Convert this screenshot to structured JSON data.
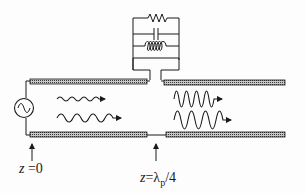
{
  "diagram": {
    "type": "transmission-line-with-shunt-resonator",
    "colors": {
      "ink": "#1a1a1a",
      "conductor_fill": "#8a8a8a",
      "background": "#fdfdfd"
    },
    "components": {
      "source": {
        "icon": "ac-source-icon"
      },
      "resonator": {
        "elements": [
          "resistor",
          "capacitor",
          "inductor"
        ],
        "connection": "parallel"
      },
      "conductors": [
        "top-left",
        "top-right",
        "bottom-left",
        "bottom-right"
      ]
    },
    "waves": {
      "left": [
        {
          "amplitude": "small",
          "direction": "right"
        },
        {
          "amplitude": "medium",
          "direction": "right"
        }
      ],
      "right": [
        {
          "amplitude": "large",
          "direction": "right"
        },
        {
          "amplitude": "large",
          "direction": "right"
        }
      ]
    },
    "labels": {
      "z0_var": "z",
      "z0_eq": " =0",
      "zq_var": "z",
      "zq_eq": "=λ",
      "zq_sub": "p",
      "zq_tail": "/4"
    }
  }
}
